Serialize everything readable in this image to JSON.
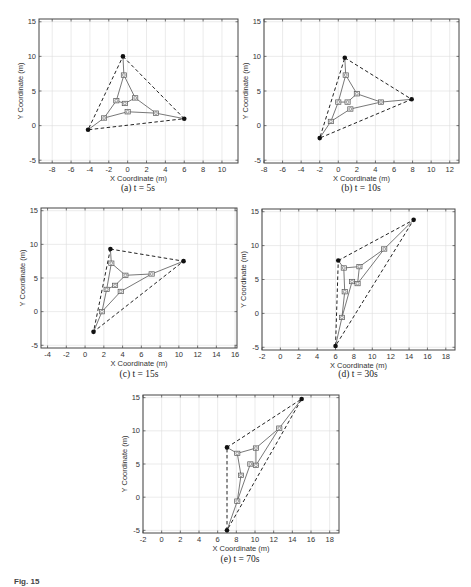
{
  "figure": {
    "caption_partial": "Fig. 15",
    "colors": {
      "axes": "#444444",
      "grid": "#dddddd",
      "robot": "#555555",
      "leader": "#111111",
      "dashed": "#222222"
    }
  },
  "chart_data": [
    {
      "type": "scatter",
      "panel": "a",
      "caption": "(a) t = 5s",
      "xlabel": "X Coordinate (m)",
      "ylabel": "Y Coordinate (m)",
      "xlim": [
        -9.4,
        11.7
      ],
      "ylim": [
        -5.4,
        15.4
      ],
      "xticks": [
        -8,
        -6,
        -4,
        -2,
        0,
        2,
        4,
        6,
        8,
        10
      ],
      "yticks": [
        -5,
        0,
        5,
        10,
        15
      ],
      "grid": true,
      "leaders": [
        [
          -0.5,
          10
        ],
        [
          6,
          1
        ],
        [
          -4.2,
          -0.6
        ]
      ],
      "followers": [
        [
          -0.4,
          7.3
        ],
        [
          0.8,
          4
        ],
        [
          -1.2,
          3.6
        ],
        [
          -0.3,
          3.2
        ],
        [
          0,
          2
        ],
        [
          -2.5,
          1.1
        ],
        [
          3,
          1.8
        ]
      ],
      "solid_edges": [
        [
          [
            -0.5,
            10
          ],
          [
            -0.4,
            7.3
          ]
        ],
        [
          [
            -0.4,
            7.3
          ],
          [
            -1.2,
            3.6
          ]
        ],
        [
          [
            -0.4,
            7.3
          ],
          [
            0.8,
            4
          ]
        ],
        [
          [
            0.8,
            4
          ],
          [
            3,
            1.8
          ]
        ],
        [
          [
            3,
            1.8
          ],
          [
            6,
            1
          ]
        ],
        [
          [
            -1.2,
            3.6
          ],
          [
            -2.5,
            1.1
          ]
        ],
        [
          [
            -2.5,
            1.1
          ],
          [
            -4.2,
            -0.6
          ]
        ],
        [
          [
            -2.5,
            1.1
          ],
          [
            0,
            2
          ]
        ],
        [
          [
            0,
            2
          ],
          [
            3,
            1.8
          ]
        ],
        [
          [
            -1.2,
            3.6
          ],
          [
            -0.3,
            3.2
          ]
        ],
        [
          [
            -0.3,
            3.2
          ],
          [
            0.8,
            4
          ]
        ]
      ],
      "dashed_triangle": [
        [
          -0.5,
          10
        ],
        [
          6,
          1
        ],
        [
          -4.2,
          -0.6
        ]
      ]
    },
    {
      "type": "scatter",
      "panel": "b",
      "caption": "(b) t = 10s",
      "xlabel": "X Coordinate (m)",
      "ylabel": "Y Coordinate (m)",
      "xlim": [
        -8,
        13
      ],
      "ylim": [
        -5.4,
        15.4
      ],
      "xticks": [
        -8,
        -6,
        -4,
        -2,
        0,
        2,
        4,
        6,
        8,
        10,
        12
      ],
      "yticks": [
        -5,
        0,
        5,
        10,
        15
      ],
      "grid": true,
      "leaders": [
        [
          0.7,
          9.8
        ],
        [
          7.9,
          3.8
        ],
        [
          -2,
          -1.8
        ]
      ],
      "followers": [
        [
          0.8,
          7.3
        ],
        [
          2,
          4.6
        ],
        [
          0,
          3.4
        ],
        [
          1,
          3.4
        ],
        [
          1.3,
          2.4
        ],
        [
          -0.8,
          0.6
        ],
        [
          4.6,
          3.4
        ]
      ],
      "solid_edges": [
        [
          [
            0.7,
            9.8
          ],
          [
            0.8,
            7.3
          ]
        ],
        [
          [
            0.8,
            7.3
          ],
          [
            0,
            3.4
          ]
        ],
        [
          [
            0.8,
            7.3
          ],
          [
            2,
            4.6
          ]
        ],
        [
          [
            2,
            4.6
          ],
          [
            4.6,
            3.4
          ]
        ],
        [
          [
            4.6,
            3.4
          ],
          [
            7.9,
            3.8
          ]
        ],
        [
          [
            0,
            3.4
          ],
          [
            -0.8,
            0.6
          ]
        ],
        [
          [
            -0.8,
            0.6
          ],
          [
            -2,
            -1.8
          ]
        ],
        [
          [
            -0.8,
            0.6
          ],
          [
            1.3,
            2.4
          ]
        ],
        [
          [
            1.3,
            2.4
          ],
          [
            4.6,
            3.4
          ]
        ],
        [
          [
            0,
            3.4
          ],
          [
            1,
            3.4
          ]
        ],
        [
          [
            1,
            3.4
          ],
          [
            2,
            4.6
          ]
        ]
      ],
      "dashed_triangle": [
        [
          0.7,
          9.8
        ],
        [
          7.9,
          3.8
        ],
        [
          -2,
          -1.8
        ]
      ]
    },
    {
      "type": "scatter",
      "panel": "c",
      "caption": "(c) t = 15s",
      "xlabel": "X Coordinate (m)",
      "ylabel": "Y Coordinate (m)",
      "xlim": [
        -4.7,
        16.2
      ],
      "ylim": [
        -5.4,
        15.4
      ],
      "xticks": [
        -4,
        -2,
        0,
        2,
        4,
        6,
        8,
        10,
        12,
        14,
        16
      ],
      "yticks": [
        -5,
        0,
        5,
        10,
        15
      ],
      "grid": true,
      "leaders": [
        [
          2.7,
          9.3
        ],
        [
          10.5,
          7.5
        ],
        [
          0.9,
          -3
        ]
      ],
      "followers": [
        [
          2.8,
          7.2
        ],
        [
          4.3,
          5.4
        ],
        [
          2.3,
          3.3
        ],
        [
          3.2,
          3.9
        ],
        [
          3.8,
          3
        ],
        [
          1.8,
          0
        ],
        [
          7.1,
          5.6
        ]
      ],
      "solid_edges": [
        [
          [
            2.7,
            9.3
          ],
          [
            2.8,
            7.2
          ]
        ],
        [
          [
            2.8,
            7.2
          ],
          [
            2.3,
            3.3
          ]
        ],
        [
          [
            2.8,
            7.2
          ],
          [
            4.3,
            5.4
          ]
        ],
        [
          [
            4.3,
            5.4
          ],
          [
            7.1,
            5.6
          ]
        ],
        [
          [
            7.1,
            5.6
          ],
          [
            10.5,
            7.5
          ]
        ],
        [
          [
            2.3,
            3.3
          ],
          [
            1.8,
            0
          ]
        ],
        [
          [
            1.8,
            0
          ],
          [
            0.9,
            -3
          ]
        ],
        [
          [
            1.8,
            0
          ],
          [
            3.8,
            3
          ]
        ],
        [
          [
            3.8,
            3
          ],
          [
            7.1,
            5.6
          ]
        ],
        [
          [
            2.3,
            3.3
          ],
          [
            3.2,
            3.9
          ]
        ],
        [
          [
            3.2,
            3.9
          ],
          [
            4.3,
            5.4
          ]
        ]
      ],
      "dashed_triangle": [
        [
          2.7,
          9.3
        ],
        [
          10.5,
          7.5
        ],
        [
          0.9,
          -3
        ]
      ]
    },
    {
      "type": "scatter",
      "panel": "d",
      "caption": "(d) t = 30s",
      "xlabel": "X Coordinate (m)",
      "ylabel": "Y Coordinate (m)",
      "xlim": [
        -2,
        19
      ],
      "ylim": [
        -5.4,
        15.4
      ],
      "xticks": [
        -2,
        0,
        2,
        4,
        6,
        8,
        10,
        12,
        14,
        16,
        18
      ],
      "yticks": [
        -5,
        0,
        5,
        10,
        15
      ],
      "grid": true,
      "leaders": [
        [
          6.3,
          7.8
        ],
        [
          14.5,
          13.8
        ],
        [
          6,
          -4.8
        ]
      ],
      "followers": [
        [
          6.9,
          6.7
        ],
        [
          8.6,
          6.9
        ],
        [
          7.8,
          4.7
        ],
        [
          8.4,
          4.4
        ],
        [
          7,
          3.2
        ],
        [
          6.7,
          -0.6
        ],
        [
          11.3,
          9.5
        ]
      ],
      "solid_edges": [
        [
          [
            6.3,
            7.8
          ],
          [
            6.9,
            6.7
          ]
        ],
        [
          [
            6.9,
            6.7
          ],
          [
            8.6,
            6.9
          ]
        ],
        [
          [
            6.9,
            6.7
          ],
          [
            7,
            3.2
          ]
        ],
        [
          [
            8.6,
            6.9
          ],
          [
            11.3,
            9.5
          ]
        ],
        [
          [
            11.3,
            9.5
          ],
          [
            14.5,
            13.8
          ]
        ],
        [
          [
            7,
            3.2
          ],
          [
            6.7,
            -0.6
          ]
        ],
        [
          [
            6.7,
            -0.6
          ],
          [
            6,
            -4.8
          ]
        ],
        [
          [
            6.7,
            -0.6
          ],
          [
            7.8,
            4.7
          ]
        ],
        [
          [
            7.8,
            4.7
          ],
          [
            8.4,
            4.4
          ]
        ],
        [
          [
            8.4,
            4.4
          ],
          [
            11.3,
            9.5
          ]
        ],
        [
          [
            8.4,
            4.4
          ],
          [
            8.6,
            6.9
          ]
        ]
      ],
      "dashed_triangle": [
        [
          6.3,
          7.8
        ],
        [
          14.5,
          13.8
        ],
        [
          6,
          -4.8
        ]
      ]
    },
    {
      "type": "scatter",
      "panel": "e",
      "caption": "(e) t = 70s",
      "xlabel": "X Coordinate (m)",
      "ylabel": "Y Coordinate (m)",
      "xlim": [
        -2,
        19
      ],
      "ylim": [
        -5.4,
        15.4
      ],
      "xticks": [
        -2,
        0,
        2,
        4,
        6,
        8,
        10,
        12,
        14,
        16,
        18
      ],
      "yticks": [
        -5,
        0,
        5,
        10,
        15
      ],
      "grid": true,
      "leaders": [
        [
          7,
          7.5
        ],
        [
          15,
          14.8
        ],
        [
          7,
          -5
        ]
      ],
      "followers": [
        [
          8.1,
          6.6
        ],
        [
          10.1,
          7.4
        ],
        [
          9.5,
          5
        ],
        [
          10.1,
          4.8
        ],
        [
          8.5,
          3.3
        ],
        [
          8.1,
          -0.6
        ],
        [
          12.6,
          10.4
        ]
      ],
      "solid_edges": [
        [
          [
            7,
            7.5
          ],
          [
            8.1,
            6.6
          ]
        ],
        [
          [
            8.1,
            6.6
          ],
          [
            10.1,
            7.4
          ]
        ],
        [
          [
            8.1,
            6.6
          ],
          [
            8.5,
            3.3
          ]
        ],
        [
          [
            10.1,
            7.4
          ],
          [
            12.6,
            10.4
          ]
        ],
        [
          [
            12.6,
            10.4
          ],
          [
            15,
            14.8
          ]
        ],
        [
          [
            8.5,
            3.3
          ],
          [
            8.1,
            -0.6
          ]
        ],
        [
          [
            8.1,
            -0.6
          ],
          [
            7,
            -5
          ]
        ],
        [
          [
            8.1,
            -0.6
          ],
          [
            9.5,
            5
          ]
        ],
        [
          [
            9.5,
            5
          ],
          [
            10.1,
            4.8
          ]
        ],
        [
          [
            10.1,
            4.8
          ],
          [
            12.6,
            10.4
          ]
        ],
        [
          [
            10.1,
            4.8
          ],
          [
            10.1,
            7.4
          ]
        ]
      ],
      "dashed_triangle": [
        [
          7,
          7.5
        ],
        [
          15,
          14.8
        ],
        [
          7,
          -5
        ]
      ]
    }
  ],
  "layout": {
    "panels": [
      {
        "box": [
          39,
          19,
          238,
          163
        ],
        "caption_xy": [
          138,
          191
        ]
      },
      {
        "box": [
          264,
          19,
          459,
          163
        ],
        "caption_xy": [
          361,
          191
        ]
      },
      {
        "box": [
          41,
          208,
          237,
          348
        ],
        "caption_xy": [
          139,
          377
        ]
      },
      {
        "box": [
          262,
          209,
          455,
          350
        ],
        "caption_xy": [
          358,
          377
        ]
      },
      {
        "box": [
          143,
          395,
          339,
          533
        ],
        "caption_xy": [
          240,
          562
        ]
      }
    ]
  }
}
